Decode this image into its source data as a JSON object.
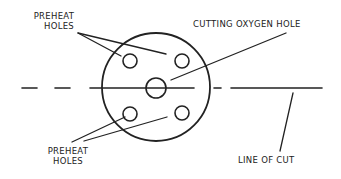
{
  "diagram": {
    "labels": {
      "preheat_top_line1": "PREHEAT",
      "preheat_top_line2": "HOLES",
      "cutting_oxygen": "CUTTING OXYGEN HOLE",
      "preheat_bottom_line1": "PREHEAT",
      "preheat_bottom_line2": "HOLES",
      "line_of_cut": "LINE OF CUT"
    },
    "colors": {
      "stroke": "#222222",
      "background": "#ffffff",
      "text": "#222222"
    }
  }
}
